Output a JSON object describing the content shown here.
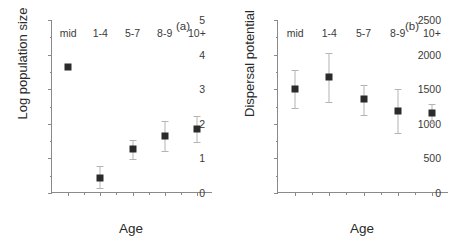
{
  "figure": {
    "background": "#ffffff",
    "marker_color": "#2b2b2b",
    "errorbar_color": "#b4b4b4",
    "axis_color": "#8a8a8a"
  },
  "chart_data": [
    {
      "type": "scatter",
      "panel_tag": "(a)",
      "title": "",
      "xlabel": "Age",
      "ylabel": "Log population size",
      "categories": [
        "mid",
        "1-4",
        "5-7",
        "8-9",
        "10+"
      ],
      "values": [
        3.63,
        0.44,
        1.28,
        1.64,
        1.85
      ],
      "err_low": [
        3.63,
        0.15,
        0.97,
        1.21,
        1.47
      ],
      "err_high": [
        3.63,
        0.78,
        1.52,
        2.07,
        2.22
      ],
      "ylim": [
        0,
        5
      ],
      "yticks": [
        0,
        1,
        2,
        3,
        4,
        5
      ],
      "ytick_labels": [
        "0",
        "1",
        "2",
        "3",
        "4",
        "5"
      ],
      "yminor_step": 0.5,
      "grid": false,
      "legend": "none",
      "errorbars": "vertical, capped; 'mid' has no visible error bar"
    },
    {
      "type": "scatter",
      "panel_tag": "(b)",
      "title": "",
      "xlabel": "Age",
      "ylabel": "Dispersal potential",
      "categories": [
        "mid",
        "1-4",
        "5-7",
        "8-9",
        "10+"
      ],
      "values": [
        1500,
        1670,
        1355,
        1190,
        1150
      ],
      "err_low": [
        1225,
        1310,
        1130,
        870,
        1010
      ],
      "err_high": [
        1780,
        2020,
        1560,
        1510,
        1290
      ],
      "ylim": [
        0,
        2500
      ],
      "yticks": [
        0,
        500,
        1000,
        1500,
        2000,
        2500
      ],
      "ytick_labels": [
        "0",
        "500",
        "1000",
        "1500",
        "2000",
        "2500"
      ],
      "yminor_step": 250,
      "grid": false,
      "legend": "none",
      "errorbars": "vertical, capped"
    }
  ]
}
